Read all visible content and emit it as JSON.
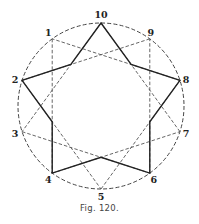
{
  "diagram": {
    "type": "star polygon {10/3} inscribed in circle with pentagram-shaped solid outline",
    "circle": {
      "cx": 101,
      "cy": 106,
      "r": 83,
      "style": "dashed"
    },
    "vertices": [
      {
        "label": "1",
        "angle_deg": -126,
        "label_dx": -4,
        "label_dy": -3
      },
      {
        "label": "2",
        "angle_deg": -162,
        "label_dx": -7,
        "label_dy": 3
      },
      {
        "label": "3",
        "angle_deg": -198,
        "label_dx": -7,
        "label_dy": 5
      },
      {
        "label": "4",
        "angle_deg": -234,
        "label_dx": -4,
        "label_dy": 10
      },
      {
        "label": "5",
        "angle_deg": -270,
        "label_dx": 0,
        "label_dy": 11
      },
      {
        "label": "6",
        "angle_deg": -306,
        "label_dx": 4,
        "label_dy": 10
      },
      {
        "label": "7",
        "angle_deg": -342,
        "label_dx": 6,
        "label_dy": 5
      },
      {
        "label": "8",
        "angle_deg": -378,
        "label_dx": 6,
        "label_dy": 3
      },
      {
        "label": "9",
        "angle_deg": -414,
        "label_dx": 1,
        "label_dy": -3
      },
      {
        "label": "10",
        "angle_deg": -90,
        "label_dx": 0,
        "label_dy": -5
      }
    ],
    "dashed_chords_step": 3,
    "solid_star_points": [
      "10",
      "8",
      "6",
      "4",
      "2"
    ]
  },
  "caption": "Fig. 120."
}
